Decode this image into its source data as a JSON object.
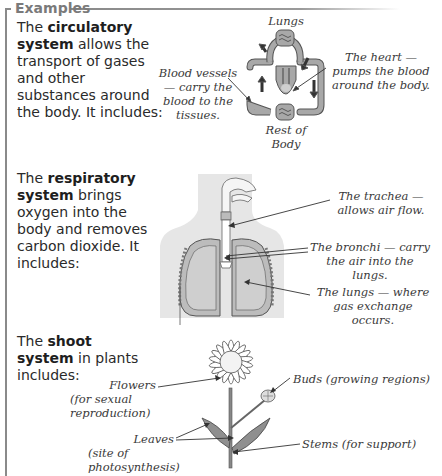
{
  "section_title": "Examples",
  "circulatory": {
    "intro_prefix": "The ",
    "intro_bold": "circulatory system",
    "intro_rest": " allows the transport of gases and other substances around the body.  It includes:",
    "labels": {
      "lungs": "Lungs",
      "rest_of_body": "Rest of Body",
      "blood_vessels": "Blood vessels — carry the blood to the tissues.",
      "heart": "The heart — pumps the blood around the body."
    }
  },
  "respiratory": {
    "intro_prefix": "The ",
    "intro_bold": "respiratory system",
    "intro_rest": " brings oxygen into the body and removes carbon dioxide. It includes:",
    "labels": {
      "trachea": "The trachea — allows air flow.",
      "bronchi": "The bronchi — carry the air into the lungs.",
      "lungs": "The lungs — where gas exchange occurs."
    }
  },
  "shoot": {
    "intro_prefix": "The ",
    "intro_bold": "shoot system",
    "intro_rest": " in plants includes:",
    "labels": {
      "flowers": "Flowers",
      "flowers_note": "(for sexual reproduction)",
      "leaves": "Leaves",
      "leaves_note": "(site of photosynthesis)",
      "buds": "Buds (growing regions)",
      "stems": "Stems (for support)"
    }
  },
  "colors": {
    "frame": "#8a8a8a",
    "title": "#7a7a7a",
    "diagram_fill": "#a8a8a8",
    "body_silhouette": "#e6e6e6"
  }
}
